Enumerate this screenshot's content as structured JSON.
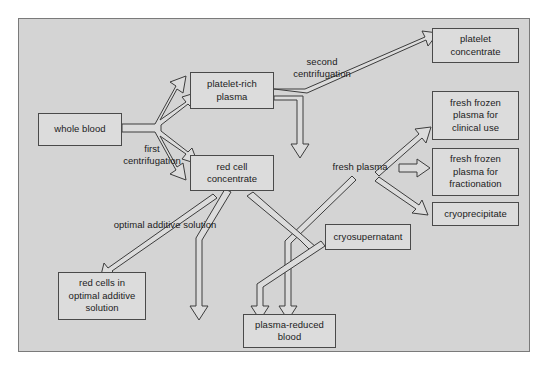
{
  "figure": {
    "panel": {
      "background_color": "#d4d4d4",
      "border_color": "#7a7a7a"
    },
    "style": {
      "node_fill": "#dcdcdc",
      "node_border": "#4a4a4a",
      "arrow_stroke": "#3c3c3c",
      "text_color": "#1b1b1b"
    }
  },
  "nodes": [
    {
      "id": "whole-blood",
      "text": "whole blood",
      "x": 38,
      "y": 113,
      "w": 84,
      "h": 33
    },
    {
      "id": "platelet-rich-plasma",
      "text": "platelet-rich\nplasma",
      "x": 190,
      "y": 72,
      "w": 84,
      "h": 37
    },
    {
      "id": "red-cell-concentrate",
      "text": "red cell\nconcentrate",
      "x": 190,
      "y": 155,
      "w": 84,
      "h": 36
    },
    {
      "id": "platelet-concentrate",
      "text": "platelet\nconcentrate",
      "x": 432,
      "y": 28,
      "w": 87,
      "h": 35
    },
    {
      "id": "ffp-clinical",
      "text": "fresh frozen\nplasma for\nclinical use",
      "x": 432,
      "y": 91,
      "w": 87,
      "h": 49
    },
    {
      "id": "ffp-fractionation",
      "text": "fresh frozen\nplasma for\nfractionation",
      "x": 432,
      "y": 148,
      "w": 87,
      "h": 48
    },
    {
      "id": "cryoprecipitate",
      "text": "cryoprecipitate",
      "x": 432,
      "y": 202,
      "w": 87,
      "h": 24
    },
    {
      "id": "cryosupernatant",
      "text": "cryosupernatant",
      "x": 325,
      "y": 224,
      "w": 86,
      "h": 26
    },
    {
      "id": "red-cells-optimal",
      "text": "red cells in\noptimal additive\nsolution",
      "x": 58,
      "y": 272,
      "w": 88,
      "h": 48
    },
    {
      "id": "plasma-reduced-blood",
      "text": "plasma-reduced\nblood",
      "x": 243,
      "y": 314,
      "w": 93,
      "h": 34
    }
  ],
  "labels": [
    {
      "id": "fresh-plasma",
      "text": "fresh plasma",
      "x": 322,
      "y": 159,
      "w": 76,
      "h": 16
    },
    {
      "id": "first-centrifugation",
      "text": "first\ncentrifugation",
      "x": 110,
      "y": 142,
      "w": 84,
      "h": 26
    },
    {
      "id": "second-centrifugation",
      "text": "second\ncentrifugation",
      "x": 280,
      "y": 55,
      "w": 84,
      "h": 26
    },
    {
      "id": "optimal-additive",
      "text": "optimal additive solution",
      "x": 100,
      "y": 218,
      "w": 130,
      "h": 14
    }
  ],
  "edges": [
    {
      "id": "whole-blood-to-platelet-rich-plasma",
      "from": "whole blood",
      "to": "platelet-rich plasma",
      "label": "first centrifugation"
    },
    {
      "id": "whole-blood-to-red-cell-concentrate",
      "from": "whole blood",
      "to": "red cell concentrate",
      "label": "first centrifugation"
    },
    {
      "id": "prp-to-platelet-concentrate",
      "from": "platelet-rich plasma",
      "to": "platelet concentrate",
      "label": "second centrifugation"
    },
    {
      "id": "prp-to-fresh-plasma",
      "from": "platelet-rich plasma",
      "to": "fresh plasma",
      "label": "second centrifugation"
    },
    {
      "id": "fresh-plasma-to-ffp-clinical",
      "from": "fresh plasma",
      "to": "fresh frozen plasma for clinical use",
      "label": ""
    },
    {
      "id": "fresh-plasma-to-ffp-fractionation",
      "from": "fresh plasma",
      "to": "fresh frozen plasma for fractionation",
      "label": ""
    },
    {
      "id": "fresh-plasma-to-cryoprecipitate",
      "from": "fresh plasma",
      "to": "cryoprecipitate",
      "label": ""
    },
    {
      "id": "fresh-plasma-to-cryosupernatant",
      "from": "fresh plasma",
      "to": "cryosupernatant",
      "label": ""
    },
    {
      "id": "rcc-to-red-cells-optimal",
      "from": "red cell concentrate",
      "to": "red cells in optimal additive solution",
      "label": "optimal additive solution"
    },
    {
      "id": "rcc-to-plasma-reduced-blood",
      "from": "red cell concentrate",
      "to": "plasma-reduced blood",
      "label": ""
    },
    {
      "id": "cryosupernatant-to-plasma-reduced-blood",
      "from": "cryosupernatant",
      "to": "plasma-reduced blood",
      "label": ""
    }
  ]
}
